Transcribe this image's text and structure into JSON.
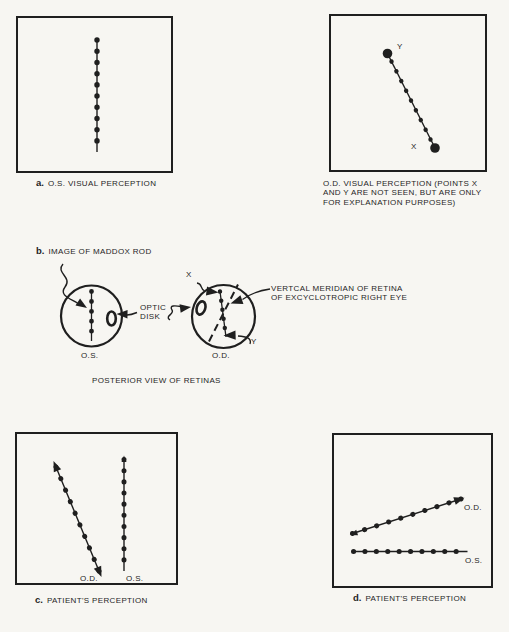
{
  "colors": {
    "ink": "#1f1f1f",
    "paper": "#f7f6f2"
  },
  "panel_a": {
    "caption_letter": "a.",
    "caption_text": "O.S. VISUAL PERCEPTION"
  },
  "panel_od_perception": {
    "point_y": "Y",
    "point_x": "X",
    "caption_lines": [
      "O.D. VISUAL PERCEPTION (POINTS X",
      "AND Y ARE NOT SEEN, BUT ARE ONLY",
      "FOR EXPLANATION PURPOSES)"
    ]
  },
  "section_b": {
    "caption_letter": "b.",
    "caption_text": "IMAGE OF MADDOX ROD",
    "point_x": "X",
    "point_y": "Y",
    "optic_disk_lines": [
      "OPTIC",
      "DISK"
    ],
    "meridian_lines": [
      "VERTCAL MERIDIAN OF RETINA",
      "OF EXCYCLOTROPIC RIGHT EYE"
    ],
    "left_eye": "O.S.",
    "right_eye": "O.D.",
    "footer": "POSTERIOR VIEW OF RETINAS"
  },
  "panel_c": {
    "caption_letter": "c.",
    "caption_text": "PATIENT'S PERCEPTION",
    "od": "O.D.",
    "os": "O.S."
  },
  "panel_d": {
    "caption_letter": "d.",
    "caption_text": "PATIENT'S PERCEPTION",
    "od": "O.D.",
    "os": "O.S."
  }
}
